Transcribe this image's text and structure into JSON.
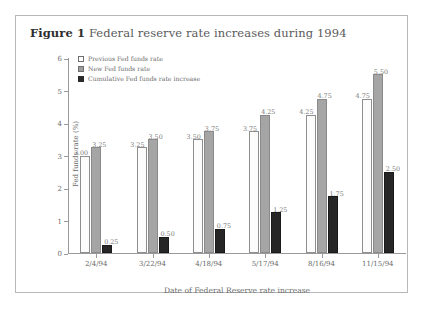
{
  "figure": {
    "label": "Figure 1",
    "title": "Federal reserve rate increases during 1994"
  },
  "colors": {
    "previous": "#ffffff",
    "new": "#a5a5a5",
    "cumulative": "#262626",
    "axis": "#9a9a9a",
    "text": "#6b6b6b",
    "frame": "#b8b8b8"
  },
  "chart_data": {
    "type": "bar",
    "title": "Federal reserve rate increases during 1994",
    "xlabel": "Date of Federal Reserve rate increase",
    "ylabel": "Fed funds rate (%)",
    "ylim": [
      0,
      6
    ],
    "yticks": [
      0,
      1,
      2,
      3,
      4,
      5,
      6
    ],
    "ytick_labels": [
      "0",
      "1",
      "2",
      "3",
      "4",
      "5",
      "6"
    ],
    "grid": false,
    "legend_position": "top-left",
    "categories": [
      "2/4/94",
      "3/22/94",
      "4/18/94",
      "5/17/94",
      "8/16/94",
      "11/15/94"
    ],
    "series": [
      {
        "name": "Previous Fed funds rate",
        "values": [
          3.0,
          3.25,
          3.5,
          3.75,
          4.25,
          4.75
        ],
        "labels": [
          "3.00",
          "3.25",
          "3.50",
          "3.75",
          "4.25",
          "4.75"
        ],
        "color": "#ffffff"
      },
      {
        "name": "New Fed funds rate",
        "values": [
          3.25,
          3.5,
          3.75,
          4.25,
          4.75,
          5.5
        ],
        "labels": [
          "3.25",
          "3.50",
          "3.75",
          "4.25",
          "4.75",
          "5.50"
        ],
        "color": "#a5a5a5"
      },
      {
        "name": "Cumulative Fed funds rate increase",
        "values": [
          0.25,
          0.5,
          0.75,
          1.25,
          1.75,
          2.5
        ],
        "labels": [
          "0.25",
          "0.50",
          "0.75",
          "1.25",
          "1.75",
          "2.50"
        ],
        "color": "#262626"
      }
    ]
  }
}
